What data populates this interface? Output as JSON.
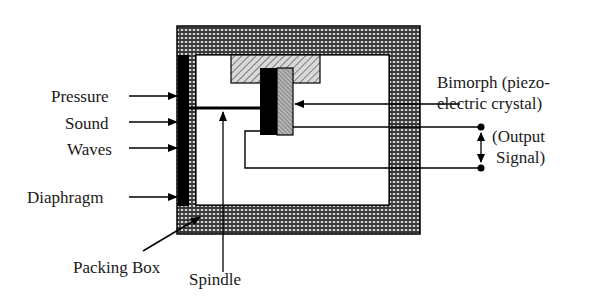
{
  "diagram": {
    "type": "piezoelectric-microphone-schematic",
    "labels": {
      "pressure": "Pressure",
      "sound": "Sound",
      "waves": "Waves",
      "diaphragm": "Diaphragm",
      "bimorph_line1": "Bimorph (piezo-",
      "bimorph_line2": "electric crystal)",
      "output_line1": "(Output",
      "output_line2": "Signal)",
      "packing_box": "Packing Box",
      "spindle": "Spindle"
    },
    "colors": {
      "housing_fill": "#8c8c8c",
      "diaphragm": "#000000",
      "mount_hatch": "#a0a0a0",
      "crystal_dark": "#000000",
      "crystal_light": "#9a9a9a",
      "line": "#000000"
    }
  }
}
